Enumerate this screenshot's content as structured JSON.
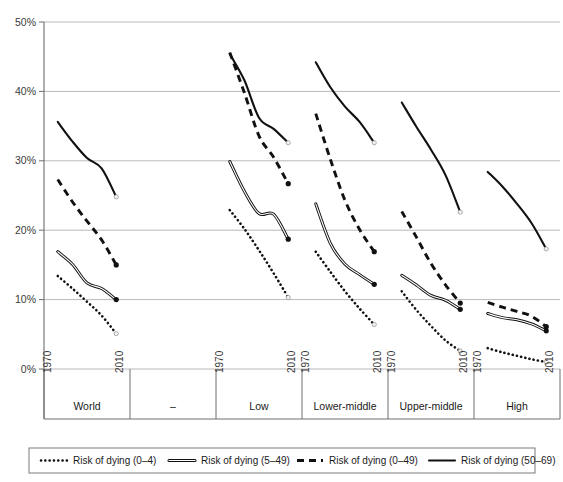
{
  "chart_data": {
    "type": "line",
    "title": "",
    "xlabel": "",
    "ylabel": "",
    "ylim": [
      0,
      50
    ],
    "yticks": [
      0,
      10,
      20,
      30,
      40,
      50
    ],
    "ytick_labels": [
      "0%",
      "10%",
      "20%",
      "30%",
      "40%",
      "50%"
    ],
    "grid": true,
    "legend_position": "bottom",
    "x_years": [
      1970,
      1980,
      1990,
      2000,
      2010
    ],
    "groups": [
      {
        "name": "World",
        "start_label": "1970",
        "end_label": "2010",
        "series": {
          "risk_0_4": [
            13.4,
            11.6,
            9.7,
            7.7,
            5.1
          ],
          "risk_5_49": [
            16.9,
            15.1,
            12.4,
            11.6,
            10.0
          ],
          "risk_0_49": [
            27.3,
            24.1,
            21.3,
            18.6,
            15.0
          ],
          "risk_50_69": [
            35.6,
            32.8,
            30.4,
            28.9,
            24.8
          ]
        }
      },
      {
        "name": "–",
        "start_label": "",
        "end_label": "",
        "series": {}
      },
      {
        "name": "Low",
        "start_label": "1970",
        "end_label": "2010",
        "series": {
          "risk_0_4": [
            22.9,
            20.2,
            17.1,
            13.8,
            10.3
          ],
          "risk_5_49": [
            29.9,
            25.6,
            22.4,
            22.3,
            18.7
          ],
          "risk_0_49": [
            45.6,
            39.8,
            33.6,
            30.5,
            26.7
          ],
          "risk_50_69": [
            45.4,
            41.6,
            36.2,
            34.6,
            32.6
          ]
        }
      },
      {
        "name": "Lower-middle",
        "start_label": "1970",
        "end_label": "2010",
        "series": {
          "risk_0_4": [
            16.9,
            14.0,
            11.2,
            8.7,
            6.4
          ],
          "risk_5_49": [
            23.8,
            18.1,
            15.1,
            13.6,
            12.2
          ],
          "risk_0_49": [
            36.8,
            30.2,
            24.3,
            20.1,
            16.9
          ],
          "risk_50_69": [
            44.2,
            40.6,
            37.8,
            35.6,
            32.6
          ]
        }
      },
      {
        "name": "Upper-middle",
        "start_label": "1970",
        "end_label": "2010",
        "series": {
          "risk_0_4": [
            11.2,
            8.5,
            6.2,
            4.1,
            2.6
          ],
          "risk_5_49": [
            13.5,
            12.1,
            10.6,
            9.9,
            8.6
          ],
          "risk_0_49": [
            22.7,
            19.0,
            15.2,
            12.1,
            9.5
          ],
          "risk_50_69": [
            38.4,
            34.9,
            31.6,
            27.9,
            22.6
          ]
        }
      },
      {
        "name": "High",
        "start_label": "1970",
        "end_label": "2010",
        "series": {
          "risk_0_4": [
            3.0,
            2.4,
            1.9,
            1.4,
            1.0
          ],
          "risk_5_49": [
            8.0,
            7.4,
            7.1,
            6.5,
            5.5
          ],
          "risk_0_49": [
            9.6,
            8.9,
            8.3,
            7.6,
            6.1
          ],
          "risk_50_69": [
            28.4,
            26.3,
            23.8,
            21.0,
            17.3
          ]
        }
      }
    ],
    "legend": [
      {
        "key": "risk_0_4",
        "label": "Risk of dying (0–4)",
        "style": "dotted"
      },
      {
        "key": "risk_5_49",
        "label": "Risk of dying (5–49)",
        "style": "double"
      },
      {
        "key": "risk_0_49",
        "label": "Risk of dying (0–49)",
        "style": "dashed"
      },
      {
        "key": "risk_50_69",
        "label": "Risk of dying (50–69)",
        "style": "solid"
      }
    ],
    "colors": {
      "line": "#111111",
      "grid": "#b9b9b9",
      "axis": "#6e6e6e",
      "background": "#ffffff"
    }
  }
}
